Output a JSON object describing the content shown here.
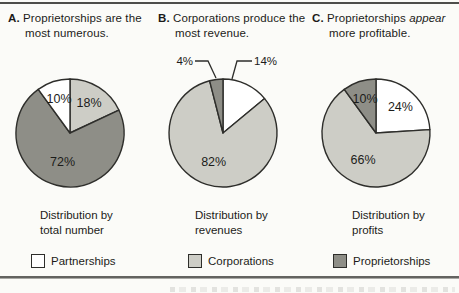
{
  "colors": {
    "partnerships": "#ffffff",
    "corporations": "#cdcdc6",
    "proprietorships": "#8e8e87",
    "outline": "#2e2e2b",
    "rule": "#4e4e4b",
    "text": "#1b1b19"
  },
  "panels": [
    {
      "letter": "A.",
      "title_line1_pre": "Proprietorships are the",
      "title_line2": "most numerous.",
      "caption_line1": "Distribution by",
      "caption_line2": "total number"
    },
    {
      "letter": "B.",
      "title_line1_pre": "Corporations produce the",
      "title_line2": "most revenue.",
      "caption_line1": "Distribution by",
      "caption_line2": "revenues"
    },
    {
      "letter": "C.",
      "title_line1_pre": "Proprietorships ",
      "title_line1_em": "appear",
      "title_line2": "more profitable.",
      "caption_line1": "Distribution by",
      "caption_line2": "profits"
    }
  ],
  "legend": [
    {
      "label": "Partnerships",
      "color_key": "partnerships"
    },
    {
      "label": "Corporations",
      "color_key": "corporations"
    },
    {
      "label": "Proprietorships",
      "color_key": "proprietorships"
    }
  ],
  "chart_data": [
    {
      "type": "pie",
      "panel": "A",
      "title": "Distribution by total number",
      "slices": [
        {
          "label": "Corporations",
          "value": 18,
          "display": "18%",
          "color_key": "corporations",
          "label_pos": "inside"
        },
        {
          "label": "Proprietorships",
          "value": 72,
          "display": "72%",
          "color_key": "proprietorships",
          "label_pos": "inside"
        },
        {
          "label": "Partnerships",
          "value": 10,
          "display": "10%",
          "color_key": "partnerships",
          "label_pos": "inside"
        }
      ]
    },
    {
      "type": "pie",
      "panel": "B",
      "title": "Distribution by revenues",
      "slices": [
        {
          "label": "Partnerships",
          "value": 14,
          "display": "14%",
          "color_key": "partnerships",
          "label_pos": "callout-right"
        },
        {
          "label": "Corporations",
          "value": 82,
          "display": "82%",
          "color_key": "corporations",
          "label_pos": "inside"
        },
        {
          "label": "Proprietorships",
          "value": 4,
          "display": "4%",
          "color_key": "proprietorships",
          "label_pos": "callout-left"
        }
      ]
    },
    {
      "type": "pie",
      "panel": "C",
      "title": "Distribution by profits",
      "slices": [
        {
          "label": "Partnerships",
          "value": 24,
          "display": "24%",
          "color_key": "partnerships",
          "label_pos": "inside"
        },
        {
          "label": "Corporations",
          "value": 66,
          "display": "66%",
          "color_key": "corporations",
          "label_pos": "inside"
        },
        {
          "label": "Proprietorships",
          "value": 10,
          "display": "10%",
          "color_key": "proprietorships",
          "label_pos": "inside"
        }
      ]
    }
  ]
}
